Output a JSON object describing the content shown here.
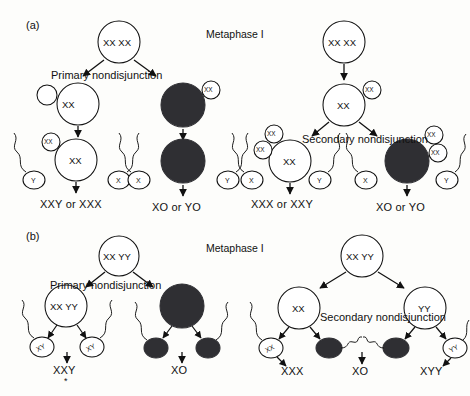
{
  "figure": {
    "type": "biology-diagram",
    "panels": [
      {
        "tag": "(a)",
        "phase_label": "Metaphase I",
        "left_branch": {
          "event_label": "Primary nondisjunction",
          "parent_cell": "XX XX",
          "ovum_left": "XX",
          "polar_body_left": "XX",
          "ovum_right": "",
          "polar_body_right": "XX",
          "sperm_left": [
            "Y",
            "X"
          ],
          "sperm_right": [
            "X",
            "Y"
          ],
          "outcome_left": "XXY or XXX",
          "outcome_right": "XO or YO"
        },
        "right_branch": {
          "event_label": "Secondary nondisjunction",
          "parent_cell": "XX XX",
          "intermediate_cell": "XX",
          "intermediate_polar_body": "XX",
          "ovum_left": "XX",
          "polar_body_left": "XX",
          "ovum_right": "",
          "polar_bodies_right": [
            "XX",
            "XX"
          ],
          "sperm_left": [
            "X",
            "Y"
          ],
          "sperm_right": [
            "X",
            "Y"
          ],
          "outcome_left": "XXX or XXY",
          "outcome_right": "XO or YO"
        }
      },
      {
        "tag": "(b)",
        "phase_label": "Metaphase I",
        "left_branch": {
          "event_label": "Primary nondisjunction",
          "parent_cell": "XX YY",
          "cell_left": "XX YY",
          "cell_right": "",
          "sperm_left": [
            "XY",
            "XY"
          ],
          "sperm_right": [
            "",
            ""
          ],
          "outcome_left": "XXY",
          "outcome_left_mark": "*",
          "outcome_right": "XO"
        },
        "right_branch": {
          "event_label": "Secondary nondisjunction",
          "parent_cell": "XX YY",
          "cell_left": "XX",
          "cell_right": "YY",
          "sperm_left": [
            "XX",
            ""
          ],
          "sperm_right": [
            "",
            "YY"
          ],
          "outcome_left": "XXX",
          "outcome_center": "XO",
          "outcome_right": "XYY"
        }
      }
    ]
  },
  "colors": {
    "stroke": "#111111",
    "fill_light": "#ffffff",
    "fill_dark": "#2f2f33",
    "background": "#fdfdfb"
  }
}
